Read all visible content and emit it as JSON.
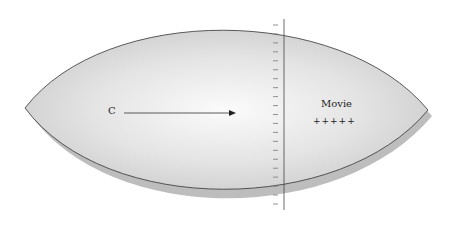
{
  "diagram": {
    "shape": "lens",
    "left_label": "C",
    "right_label": "Movie",
    "right_marks": "+++++",
    "tick_count": 21,
    "colors": {
      "fill_light": "#fafafa",
      "fill_dark": "#c8c8c8",
      "outline": "#333333",
      "shadow": "#b9b9b9"
    }
  }
}
